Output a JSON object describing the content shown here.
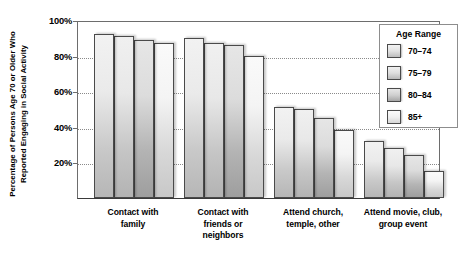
{
  "chart_data": {
    "type": "bar",
    "title": "",
    "xlabel": "",
    "ylabel": "Percentage of Persons Age 70 or Older Who Reported Engaging in Social Activity",
    "ylim": [
      0,
      100
    ],
    "yticks": [
      "20%",
      "40%",
      "60%",
      "80%",
      "100%"
    ],
    "ytick_values": [
      20,
      40,
      60,
      80,
      100
    ],
    "grid": "horizontal-dotted",
    "legend_position": "right",
    "legend_title": "Age Range",
    "categories": [
      "Contact with family",
      "Contact with friends or neighbors",
      "Attend church, temple, other",
      "Attend movie, club, group event"
    ],
    "series": [
      {
        "name": "70–74",
        "values": [
          92,
          90,
          51,
          32
        ]
      },
      {
        "name": "75–79",
        "values": [
          91,
          87,
          50,
          28
        ]
      },
      {
        "name": "80–84",
        "values": [
          89,
          86,
          45,
          24
        ]
      },
      {
        "name": "85+",
        "values": [
          87,
          80,
          38,
          15
        ]
      }
    ]
  },
  "axis": {
    "y_title": "Percentage of Persons Age 70 or Older Who Reported Engaging in Social Activity"
  },
  "legend": {
    "title": "Age Range",
    "items": [
      {
        "label": "70–74"
      },
      {
        "label": "75–79"
      },
      {
        "label": "80–84"
      },
      {
        "label": "85+"
      }
    ]
  },
  "categories_display": [
    {
      "line1": "Contact with",
      "line2": "family",
      "line3": ""
    },
    {
      "line1": "Contact with",
      "line2": "friends or",
      "line3": "neighbors"
    },
    {
      "line1": "Attend church,",
      "line2": "temple, other",
      "line3": ""
    },
    {
      "line1": "Attend movie, club,",
      "line2": "group event",
      "line3": ""
    }
  ]
}
